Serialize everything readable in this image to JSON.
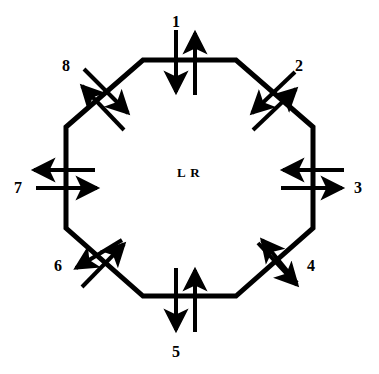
{
  "figure": {
    "type": "diagram",
    "shape": "octagon",
    "center_label": "L R",
    "stroke_color": "#000000",
    "background_color": "#ffffff",
    "ring_line_width": 5,
    "arrow_line_width": 4
  },
  "ports": [
    {
      "id": "port-1",
      "label": "1",
      "edge": "top",
      "edge_orientation": "horizontal",
      "label_x": 172,
      "label_y": 14,
      "cross_x": 189,
      "cross_y": 60,
      "arrows": [
        {
          "name": "inbound",
          "direction": "down",
          "offset": -13
        },
        {
          "name": "outbound",
          "direction": "up",
          "offset": 6
        }
      ]
    },
    {
      "id": "port-2",
      "label": "2",
      "edge": "upper-right-diagonal",
      "edge_orientation": "diagonal-135",
      "label_x": 295,
      "label_y": 58,
      "cross_x": 274,
      "cross_y": 93,
      "arrows": [
        {
          "name": "inbound",
          "direction": "down-left",
          "offset": -11
        },
        {
          "name": "outbound",
          "direction": "up-right",
          "offset": 7
        }
      ]
    },
    {
      "id": "port-3",
      "label": "3",
      "edge": "right",
      "edge_orientation": "vertical",
      "label_x": 354,
      "label_y": 180,
      "cross_x": 313,
      "cross_y": 187,
      "arrows": [
        {
          "name": "inbound",
          "direction": "left",
          "offset": -9
        },
        {
          "name": "outbound",
          "direction": "right",
          "offset": 7
        }
      ]
    },
    {
      "id": "port-4",
      "label": "4",
      "edge": "lower-right-diagonal",
      "edge_orientation": "diagonal-45",
      "label_x": 307,
      "label_y": 258,
      "cross_x": 274,
      "cross_y": 263,
      "arrows": [
        {
          "name": "inbound",
          "direction": "up-left",
          "offset": -10
        },
        {
          "name": "outbound",
          "direction": "down-right",
          "offset": 8
        }
      ]
    },
    {
      "id": "port-5",
      "label": "5",
      "edge": "bottom",
      "edge_orientation": "horizontal",
      "label_x": 172,
      "label_y": 344,
      "cross_x": 189,
      "cross_y": 296,
      "arrows": [
        {
          "name": "inbound",
          "direction": "down",
          "offset": -13
        },
        {
          "name": "outbound",
          "direction": "up",
          "offset": 6
        }
      ]
    },
    {
      "id": "port-6",
      "label": "6",
      "edge": "lower-left-diagonal",
      "edge_orientation": "diagonal-135",
      "label_x": 54,
      "label_y": 258,
      "cross_x": 105,
      "cross_y": 263,
      "arrows": [
        {
          "name": "inbound",
          "direction": "up-right",
          "offset": 9
        },
        {
          "name": "outbound",
          "direction": "down-left",
          "offset": -9
        }
      ]
    },
    {
      "id": "port-7",
      "label": "7",
      "edge": "left",
      "edge_orientation": "vertical",
      "label_x": 14,
      "label_y": 180,
      "cross_x": 66,
      "cross_y": 187,
      "arrows": [
        {
          "name": "outbound",
          "direction": "left",
          "offset": -9
        },
        {
          "name": "inbound",
          "direction": "right",
          "offset": 7
        }
      ]
    },
    {
      "id": "port-8",
      "label": "8",
      "edge": "upper-left-diagonal",
      "edge_orientation": "diagonal-45",
      "label_x": 62,
      "label_y": 58,
      "cross_x": 105,
      "cross_y": 93,
      "arrows": [
        {
          "name": "outbound",
          "direction": "up-left",
          "offset": -10
        },
        {
          "name": "inbound",
          "direction": "down-right",
          "offset": 8
        }
      ]
    }
  ],
  "geometry": {
    "octagon_vertices": [
      {
        "x": 143,
        "y": 60
      },
      {
        "x": 236,
        "y": 60
      },
      {
        "x": 313,
        "y": 127
      },
      {
        "x": 313,
        "y": 228
      },
      {
        "x": 236,
        "y": 296
      },
      {
        "x": 143,
        "y": 296
      },
      {
        "x": 66,
        "y": 228
      },
      {
        "x": 66,
        "y": 127
      }
    ]
  }
}
